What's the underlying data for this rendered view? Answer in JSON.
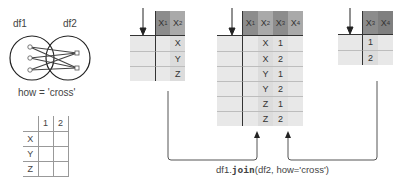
{
  "venn": {
    "left_label": "df1",
    "right_label": "df2",
    "caption": "how = 'cross'"
  },
  "matrix": {
    "col_headers": [
      "1",
      "2"
    ],
    "row_headers": [
      "X",
      "Y",
      "Z"
    ]
  },
  "left_table": {
    "headers": [
      {
        "base": "X",
        "sub": "1"
      },
      {
        "base": "X",
        "sub": "2"
      }
    ],
    "rows": [
      [
        "",
        "X"
      ],
      [
        "",
        "Y"
      ],
      [
        "",
        "Z"
      ]
    ]
  },
  "result_table": {
    "headers": [
      {
        "base": "X",
        "sub": "1"
      },
      {
        "base": "X",
        "sub": "2"
      },
      {
        "base": "X",
        "sub": "3"
      },
      {
        "base": "X",
        "sub": "4"
      }
    ],
    "rows": [
      [
        "",
        "X",
        "1",
        ""
      ],
      [
        "",
        "X",
        "2",
        ""
      ],
      [
        "",
        "Y",
        "1",
        ""
      ],
      [
        "",
        "Y",
        "2",
        ""
      ],
      [
        "",
        "Z",
        "1",
        ""
      ],
      [
        "",
        "Z",
        "2",
        ""
      ]
    ]
  },
  "right_table": {
    "headers": [
      {
        "base": "X",
        "sub": "3"
      },
      {
        "base": "X",
        "sub": "4"
      }
    ],
    "rows": [
      [
        "1",
        ""
      ],
      [
        "2",
        ""
      ]
    ]
  },
  "code_caption": {
    "prefix": "df1.",
    "method": "join",
    "suffix": "(df2, how='cross')"
  },
  "colors": {
    "header_dark": "#8c8c8c",
    "header_mid": "#a9a9a9",
    "cell": "#e8e8e8",
    "line": "#555555"
  }
}
